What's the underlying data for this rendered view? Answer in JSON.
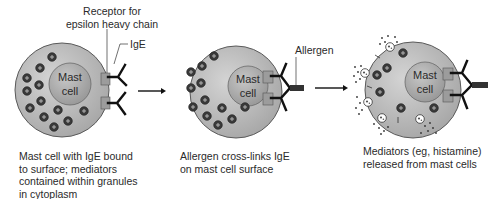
{
  "figure": {
    "type": "three-panel process diagram",
    "colors": {
      "cell_body": "#b9b9b9",
      "cell_outline": "#555555",
      "nucleus": "#a9a9a9",
      "granule": "#3d3d3d",
      "receptor": "#9a9a9a",
      "antibody": "#111111",
      "allergen": "#333333",
      "background": "#ffffff"
    }
  },
  "panels": [
    {
      "cell_label_line1": "Mast",
      "cell_label_line2": "cell",
      "callouts": {
        "receptor": "Receptor for\nepsilon heavy chain",
        "ige": "IgE"
      },
      "caption": "Mast cell with IgE bound\nto surface; mediators\ncontained within granules\nin cytoplasm"
    },
    {
      "cell_label_line1": "Mast",
      "cell_label_line2": "cell",
      "callouts": {
        "allergen": "Allergen"
      },
      "caption": "Allergen cross-links IgE\non mast cell surface"
    },
    {
      "cell_label_line1": "Mast",
      "cell_label_line2": "cell",
      "caption": "Mediators (eg, histamine)\nreleased from mast cells"
    }
  ],
  "arrows": [
    {
      "from": "panel-1",
      "to": "panel-2"
    },
    {
      "from": "panel-2",
      "to": "panel-3"
    }
  ]
}
